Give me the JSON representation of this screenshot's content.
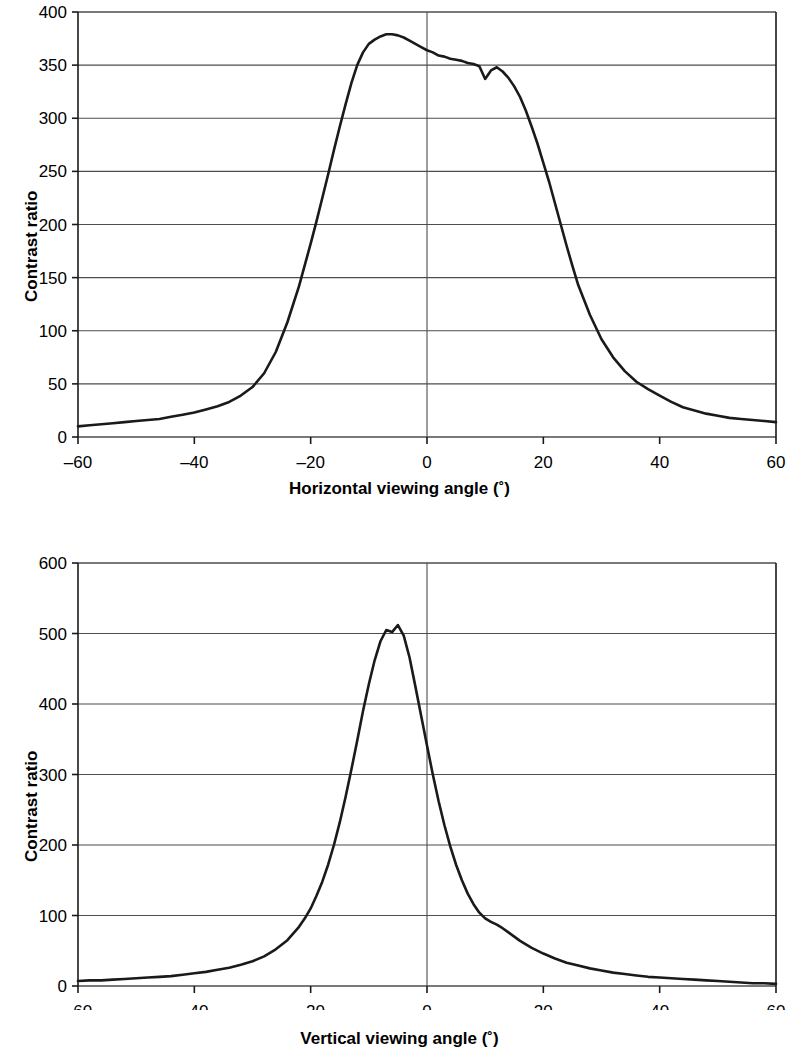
{
  "figure": {
    "background": "#ffffff",
    "line_color": "#1a1a1a",
    "grid_color": "#4d4d4d",
    "axis_color": "#1a1a1a"
  },
  "panels": [
    {
      "id": "horizontal",
      "y_axis_title": "Contrast ratio",
      "x_axis_title": "Horizontal viewing angle (˚)"
    },
    {
      "id": "vertical",
      "y_axis_title": "Contrast ratio",
      "x_axis_title": "Vertical viewing angle (˚)"
    }
  ],
  "chart_data": [
    {
      "type": "line",
      "id": "horizontal-viewing-angle-contrast",
      "title": "",
      "xlabel": "Horizontal viewing angle (˚)",
      "ylabel": "Contrast ratio",
      "xlim": [
        -60,
        60
      ],
      "ylim": [
        0,
        400
      ],
      "xticks": [
        -60,
        -40,
        -20,
        0,
        20,
        40,
        60
      ],
      "xtick_labels": [
        "–60",
        "–40",
        "–20",
        "0",
        "20",
        "40",
        "60"
      ],
      "yticks": [
        0,
        50,
        100,
        150,
        200,
        250,
        300,
        350,
        400
      ],
      "ytick_labels": [
        "0",
        "50",
        "100",
        "150",
        "200",
        "250",
        "300",
        "350",
        "400"
      ],
      "grid": "horizontal",
      "legend": "none",
      "series": [
        {
          "name": "Contrast ratio vs horizontal angle",
          "x": [
            -60,
            -58,
            -56,
            -54,
            -52,
            -50,
            -48,
            -46,
            -44,
            -42,
            -40,
            -38,
            -36,
            -34,
            -32,
            -30,
            -28,
            -26,
            -24,
            -22,
            -20,
            -19,
            -18,
            -17,
            -16,
            -15,
            -14,
            -13,
            -12,
            -11,
            -10,
            -9,
            -8,
            -7,
            -6,
            -5,
            -4,
            -3,
            -2,
            -1,
            0,
            1,
            2,
            3,
            4,
            5,
            6,
            7,
            8,
            9,
            10,
            11,
            12,
            13,
            14,
            15,
            16,
            17,
            18,
            19,
            20,
            21,
            22,
            23,
            24,
            25,
            26,
            28,
            30,
            32,
            34,
            36,
            38,
            40,
            42,
            44,
            46,
            48,
            50,
            52,
            54,
            56,
            58,
            60
          ],
          "y": [
            10,
            11,
            12,
            13,
            14,
            15,
            16,
            17,
            19,
            21,
            23,
            26,
            29,
            33,
            39,
            47,
            60,
            80,
            108,
            142,
            182,
            203,
            225,
            247,
            270,
            292,
            313,
            333,
            350,
            362,
            370,
            374,
            377,
            379,
            379,
            378,
            376,
            373,
            370,
            367,
            364,
            362,
            359,
            358,
            356,
            355,
            354,
            352,
            351,
            349,
            337,
            345,
            348,
            344,
            338,
            330,
            320,
            307,
            292,
            276,
            258,
            240,
            220,
            200,
            180,
            161,
            143,
            115,
            92,
            75,
            62,
            52,
            45,
            39,
            33,
            28,
            25,
            22,
            20,
            18,
            17,
            16,
            15,
            14
          ]
        }
      ]
    },
    {
      "type": "line",
      "id": "vertical-viewing-angle-contrast",
      "title": "",
      "xlabel": "Vertical viewing angle (˚)",
      "ylabel": "Contrast ratio",
      "xlim": [
        -60,
        60
      ],
      "ylim": [
        0,
        600
      ],
      "xticks": [
        -60,
        -40,
        -20,
        0,
        20,
        40,
        60
      ],
      "xtick_labels": [
        "–60",
        "–40",
        "–20",
        "0",
        "20",
        "40",
        "60"
      ],
      "yticks": [
        0,
        100,
        200,
        300,
        400,
        500,
        600
      ],
      "ytick_labels": [
        "0",
        "100",
        "200",
        "300",
        "400",
        "500",
        "600"
      ],
      "grid": "horizontal",
      "legend": "none",
      "series": [
        {
          "name": "Contrast ratio vs vertical angle",
          "x": [
            -60,
            -58,
            -56,
            -54,
            -52,
            -50,
            -48,
            -46,
            -44,
            -42,
            -40,
            -38,
            -36,
            -34,
            -32,
            -30,
            -28,
            -26,
            -24,
            -22,
            -21,
            -20,
            -19,
            -18,
            -17,
            -16,
            -15,
            -14,
            -13,
            -12,
            -11,
            -10,
            -9,
            -8,
            -7,
            -6,
            -5,
            -4,
            -3,
            -2,
            -1,
            0,
            1,
            2,
            3,
            4,
            5,
            6,
            7,
            8,
            9,
            10,
            11,
            12,
            13,
            14,
            15,
            16,
            18,
            20,
            22,
            24,
            26,
            28,
            30,
            32,
            34,
            36,
            38,
            40,
            42,
            44,
            46,
            48,
            50,
            52,
            54,
            56,
            58,
            60
          ],
          "y": [
            7,
            8,
            8,
            9,
            10,
            11,
            12,
            13,
            14,
            16,
            18,
            20,
            23,
            26,
            30,
            35,
            42,
            52,
            65,
            84,
            96,
            110,
            128,
            148,
            172,
            200,
            232,
            268,
            307,
            348,
            390,
            428,
            462,
            489,
            505,
            502,
            512,
            497,
            466,
            425,
            383,
            341,
            300,
            262,
            228,
            198,
            172,
            150,
            131,
            116,
            104,
            96,
            91,
            87,
            82,
            76,
            70,
            64,
            54,
            46,
            39,
            33,
            29,
            25,
            22,
            19,
            17,
            15,
            13,
            12,
            11,
            10,
            9,
            8,
            7,
            6,
            5,
            4,
            4,
            3
          ]
        }
      ]
    }
  ]
}
